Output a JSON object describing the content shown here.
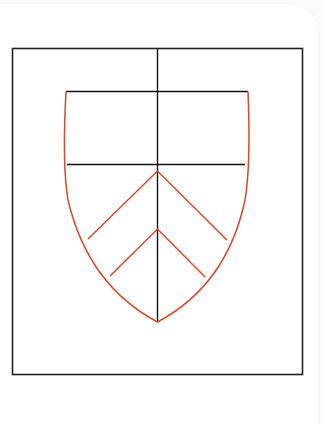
{
  "diagram": {
    "title": "",
    "type": "heraldic-shield-construction",
    "colors": {
      "frame": "#1a1a1a",
      "guides": "#1a1a1a",
      "shield_outline": "#d9472b",
      "background": "#ffffff"
    },
    "elements": [
      {
        "name": "outer-frame",
        "shape": "rectangle"
      },
      {
        "name": "vertical-center-guide",
        "shape": "line"
      },
      {
        "name": "chief-top-line",
        "shape": "line"
      },
      {
        "name": "chief-bottom-line",
        "shape": "line"
      },
      {
        "name": "shield-outline",
        "shape": "heater-shield"
      },
      {
        "name": "upper-chevron",
        "shape": "chevron"
      },
      {
        "name": "lower-chevron",
        "shape": "chevron"
      }
    ]
  }
}
